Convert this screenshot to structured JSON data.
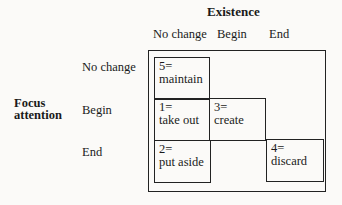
{
  "column_group_title": "Existence",
  "columns": [
    "No change",
    "Begin",
    "End"
  ],
  "row_group_title": "Focus attention",
  "row_group_title_lines": [
    "Focus",
    "attention"
  ],
  "rows": [
    "No change",
    "Begin",
    "End"
  ],
  "cells": [
    {
      "id": "5",
      "num": "5=",
      "action": "maintain",
      "row": "No change",
      "col": "No change"
    },
    {
      "id": "1",
      "num": "1=",
      "action": "take out",
      "row": "Begin",
      "col": "No change"
    },
    {
      "id": "3",
      "num": "3=",
      "action": "create",
      "row": "Begin",
      "col": "Begin"
    },
    {
      "id": "2",
      "num": "2=",
      "action": "put aside",
      "row": "End",
      "col": "No change"
    },
    {
      "id": "4",
      "num": "4=",
      "action": "discard",
      "row": "End",
      "col": "End"
    }
  ]
}
